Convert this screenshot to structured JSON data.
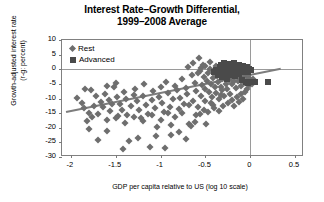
{
  "chart_data": {
    "type": "scatter",
    "title": "Interest Rate–Growth Differential,",
    "title_line2": "1999–2008 Average",
    "xlabel": "GDP per capita relative to  US (log 10 scale)",
    "ylabel": "Growth-adjusted interest rate",
    "ylabel_line2": "(r-g: percent)",
    "xlim": [
      -2.1,
      0.6
    ],
    "ylim": [
      -30,
      10
    ],
    "xticks": [
      -2,
      -1.5,
      -1,
      -0.5,
      0,
      0.5
    ],
    "xtick_labels": [
      "-2",
      "-1.5",
      "-1",
      "-0.5",
      "0",
      "0.5"
    ],
    "yticks": [
      10,
      5,
      0,
      -5,
      -10,
      -15,
      -20,
      -25,
      -30
    ],
    "ytick_labels": [
      "10",
      "5",
      "0",
      "-5",
      "-10",
      "-15",
      "-20",
      "-25",
      "-30"
    ],
    "grid": false,
    "zero_line_x": 0,
    "zero_line_y": 0,
    "legend_position": "top-left",
    "colors": {
      "rest": "#6e6e6e",
      "advanced": "#4a4a4a",
      "trend": "#7d7d7d",
      "axis": "#808080"
    },
    "legend": [
      {
        "name": "Rest",
        "marker": "diamond",
        "color": "#6e6e6e"
      },
      {
        "name": "Advanced",
        "marker": "square",
        "color": "#4a4a4a"
      }
    ],
    "trendline": {
      "x0": -2.05,
      "y0": -14.2,
      "x1": 0.35,
      "y1": 0.6
    },
    "series": [
      {
        "name": "Rest",
        "marker": "diamond",
        "color": "#6e6e6e",
        "points": [
          [
            -1.93,
            -9.8
          ],
          [
            -1.88,
            -11.6
          ],
          [
            -1.86,
            -13.4
          ],
          [
            -1.84,
            -6.6
          ],
          [
            -1.8,
            -14.8
          ],
          [
            -1.78,
            -7.2
          ],
          [
            -1.74,
            -12.4
          ],
          [
            -1.72,
            -9.2
          ],
          [
            -1.7,
            -24.2
          ],
          [
            -1.67,
            -11.2
          ],
          [
            -1.64,
            -13.0
          ],
          [
            -1.62,
            -8.4
          ],
          [
            -1.6,
            -5.6
          ],
          [
            -1.58,
            -10.6
          ],
          [
            -1.56,
            -14.4
          ],
          [
            -1.54,
            -12.0
          ],
          [
            -1.52,
            -6.2
          ],
          [
            -1.5,
            -4.6
          ],
          [
            -1.49,
            -9.6
          ],
          [
            -1.47,
            -16.0
          ],
          [
            -1.45,
            -11.8
          ],
          [
            -1.43,
            -13.8
          ],
          [
            -1.41,
            -7.8
          ],
          [
            -1.39,
            -10.2
          ],
          [
            -1.37,
            -15.6
          ],
          [
            -1.35,
            -24.4
          ],
          [
            -1.33,
            -12.6
          ],
          [
            -1.3,
            -8.8
          ],
          [
            -1.28,
            -6.8
          ],
          [
            -1.26,
            -11.0
          ],
          [
            -1.24,
            -14.0
          ],
          [
            -1.22,
            -16.6
          ],
          [
            -1.2,
            -9.0
          ],
          [
            -1.18,
            -5.0
          ],
          [
            -1.16,
            -12.2
          ],
          [
            -1.14,
            -15.2
          ],
          [
            -1.12,
            -26.6
          ],
          [
            -1.1,
            -10.4
          ],
          [
            -1.08,
            -7.4
          ],
          [
            -1.06,
            -13.2
          ],
          [
            -1.04,
            -19.8
          ],
          [
            -1.02,
            -9.4
          ],
          [
            -1.0,
            -6.0
          ],
          [
            -0.98,
            -11.4
          ],
          [
            -0.96,
            -14.6
          ],
          [
            -0.94,
            -4.2
          ],
          [
            -0.92,
            -8.2
          ],
          [
            -0.9,
            -12.8
          ],
          [
            -0.88,
            -19.2
          ],
          [
            -0.86,
            -10.0
          ],
          [
            -0.84,
            -5.8
          ],
          [
            -0.82,
            -7.0
          ],
          [
            -0.8,
            -13.6
          ],
          [
            -0.78,
            -9.9
          ],
          [
            -0.76,
            -3.4
          ],
          [
            -0.74,
            -11.9
          ],
          [
            -0.72,
            -6.4
          ],
          [
            -0.7,
            -8.6
          ],
          [
            -0.68,
            -18.8
          ],
          [
            -0.66,
            -19.4
          ],
          [
            -0.65,
            -2.0
          ],
          [
            -0.64,
            -10.8
          ],
          [
            -0.62,
            -4.8
          ],
          [
            -0.6,
            -7.6
          ],
          [
            -0.58,
            -12.9
          ],
          [
            -0.57,
            3.8
          ],
          [
            -0.56,
            -0.6
          ],
          [
            -0.55,
            -9.1
          ],
          [
            -0.54,
            -5.4
          ],
          [
            -0.53,
            1.6
          ],
          [
            -0.52,
            -2.8
          ],
          [
            -0.51,
            -6.9
          ],
          [
            -0.5,
            -10.9
          ],
          [
            -0.49,
            -18.6
          ],
          [
            -0.48,
            -4.0
          ],
          [
            -0.47,
            -1.4
          ],
          [
            -0.46,
            -7.9
          ],
          [
            -0.45,
            2.4
          ],
          [
            -0.44,
            -5.2
          ],
          [
            -0.43,
            -9.5
          ],
          [
            -0.42,
            -3.0
          ],
          [
            -0.41,
            -12.1
          ],
          [
            -0.4,
            -0.2
          ],
          [
            -0.39,
            -6.1
          ],
          [
            -0.38,
            -8.1
          ],
          [
            -0.37,
            -2.4
          ],
          [
            -0.36,
            -4.4
          ],
          [
            -0.35,
            -10.1
          ],
          [
            -0.34,
            -1.0
          ],
          [
            -0.33,
            -5.9
          ],
          [
            -0.32,
            -7.1
          ],
          [
            -0.31,
            -3.2
          ],
          [
            -0.3,
            -0.8
          ],
          [
            -0.29,
            -9.2
          ],
          [
            -0.28,
            -2.2
          ],
          [
            -0.27,
            -4.9
          ],
          [
            -0.26,
            -6.6
          ],
          [
            -0.25,
            -1.2
          ],
          [
            -0.24,
            -3.6
          ],
          [
            -0.23,
            -8.4
          ],
          [
            -0.22,
            -0.4
          ],
          [
            -0.21,
            -2.6
          ],
          [
            -0.2,
            -5.1
          ],
          [
            -0.19,
            -1.8
          ],
          [
            -0.18,
            -3.9
          ],
          [
            -0.17,
            -0.9
          ],
          [
            -0.16,
            -6.4
          ],
          [
            -0.15,
            -2.1
          ],
          [
            -0.14,
            -4.1
          ],
          [
            -0.13,
            -0.1
          ],
          [
            -0.12,
            -1.6
          ],
          [
            -0.11,
            -3.1
          ],
          [
            -0.1,
            -5.6
          ],
          [
            -0.09,
            -0.5
          ],
          [
            -0.08,
            -2.9
          ],
          [
            -0.07,
            -1.1
          ],
          [
            -0.06,
            -4.6
          ],
          [
            -0.05,
            -0.3
          ],
          [
            -0.04,
            -2.3
          ],
          [
            -0.03,
            -3.8
          ],
          [
            -0.02,
            -1.9
          ],
          [
            -0.01,
            -5.4
          ],
          [
            0.0,
            -3.4
          ],
          [
            -1.6,
            -21.0
          ],
          [
            -1.42,
            -27.2
          ],
          [
            -1.25,
            -23.6
          ],
          [
            -1.05,
            -22.8
          ],
          [
            -0.95,
            -26.8
          ],
          [
            -0.88,
            -22.4
          ],
          [
            -0.8,
            -21.6
          ],
          [
            -0.72,
            -24.0
          ],
          [
            -1.8,
            -20.4
          ],
          [
            -0.62,
            -18.2
          ],
          [
            -0.56,
            -15.4
          ],
          [
            -0.47,
            -14.6
          ],
          [
            -0.4,
            -13.4
          ],
          [
            -0.35,
            -14.2
          ],
          [
            -0.3,
            -12.4
          ],
          [
            -0.25,
            -11.6
          ],
          [
            -0.2,
            -10.4
          ],
          [
            -0.15,
            -9.4
          ],
          [
            -0.1,
            -8.6
          ],
          [
            -0.06,
            -7.8
          ],
          [
            -0.18,
            -12.6
          ],
          [
            -0.12,
            -11.2
          ],
          [
            -0.08,
            -10.0
          ],
          [
            -0.04,
            -6.8
          ],
          [
            -0.33,
            -8.9
          ],
          [
            -0.44,
            -11.4
          ],
          [
            -0.52,
            -13.9
          ],
          [
            -0.6,
            -15.8
          ],
          [
            -0.68,
            -12.2
          ],
          [
            -0.76,
            -14.9
          ],
          [
            -0.84,
            -16.4
          ],
          [
            -0.92,
            -15.0
          ],
          [
            -1.0,
            -17.4
          ],
          [
            -1.1,
            -15.8
          ],
          [
            -1.2,
            -17.8
          ],
          [
            -1.3,
            -16.2
          ],
          [
            -1.4,
            -18.4
          ],
          [
            -1.5,
            -16.8
          ],
          [
            -1.6,
            -17.2
          ],
          [
            -1.7,
            -15.4
          ],
          [
            -1.77,
            -16.2
          ],
          [
            -1.82,
            -17.8
          ],
          [
            -0.55,
            0.4
          ],
          [
            -0.5,
            1.0
          ],
          [
            -0.64,
            2.0
          ],
          [
            -0.69,
            0.8
          ],
          [
            -0.58,
            -1.2
          ],
          [
            -0.45,
            0.2
          ],
          [
            -0.38,
            1.2
          ],
          [
            -0.28,
            0.6
          ],
          [
            -0.22,
            1.4
          ],
          [
            -0.16,
            0.2
          ],
          [
            -0.11,
            1.0
          ],
          [
            -0.05,
            0.4
          ],
          [
            -0.02,
            -0.8
          ],
          [
            0.02,
            -5.0
          ],
          [
            0.03,
            -3.2
          ]
        ]
      },
      {
        "name": "Advanced",
        "marker": "square",
        "color": "#4a4a4a",
        "points": [
          [
            -0.4,
            -1.0
          ],
          [
            -0.38,
            -0.2
          ],
          [
            -0.36,
            -1.8
          ],
          [
            -0.34,
            0.6
          ],
          [
            -0.32,
            -2.6
          ],
          [
            -0.3,
            -0.6
          ],
          [
            -0.28,
            1.2
          ],
          [
            -0.27,
            -1.4
          ],
          [
            -0.26,
            -3.2
          ],
          [
            -0.25,
            0.2
          ],
          [
            -0.24,
            1.8
          ],
          [
            -0.23,
            -2.0
          ],
          [
            -0.22,
            -0.4
          ],
          [
            -0.21,
            1.0
          ],
          [
            -0.2,
            -1.2
          ],
          [
            -0.19,
            0.8
          ],
          [
            -0.18,
            2.0
          ],
          [
            -0.17,
            -2.4
          ],
          [
            -0.16,
            -0.8
          ],
          [
            -0.15,
            1.4
          ],
          [
            -0.14,
            0.4
          ],
          [
            -0.13,
            -1.6
          ],
          [
            -0.12,
            1.6
          ],
          [
            -0.11,
            -0.2
          ],
          [
            -0.1,
            0.9
          ],
          [
            -0.09,
            -3.6
          ],
          [
            -0.08,
            1.1
          ],
          [
            -0.07,
            -1.1
          ],
          [
            -0.06,
            0.3
          ],
          [
            -0.05,
            -4.2
          ],
          [
            -0.04,
            0.7
          ],
          [
            -0.03,
            -0.9
          ],
          [
            -0.02,
            -4.6
          ],
          [
            -0.01,
            0.1
          ],
          [
            0.0,
            -4.4
          ],
          [
            0.01,
            -0.4
          ],
          [
            0.05,
            -4.2
          ],
          [
            0.2,
            -4.2
          ],
          [
            -0.33,
            1.6
          ],
          [
            -0.29,
            2.2
          ],
          [
            -0.35,
            -0.4
          ],
          [
            -0.31,
            0.4
          ]
        ]
      }
    ]
  }
}
